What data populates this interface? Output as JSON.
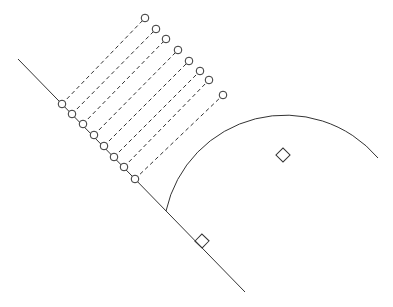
{
  "diagram": {
    "stroke_color": "#333333",
    "point_count": 8,
    "markers": {
      "right_angle": "square-marker",
      "center": "diamond-marker"
    }
  }
}
